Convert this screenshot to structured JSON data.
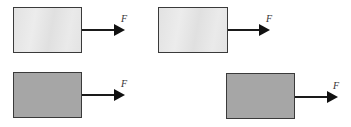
{
  "diagram": {
    "type": "force diagram",
    "panels": [
      {
        "id": "top-left",
        "block_shade": "light",
        "block_color": "#e6e6e6",
        "force_label": "F",
        "force_direction": "right"
      },
      {
        "id": "top-right",
        "block_shade": "light",
        "block_color": "#e6e6e6",
        "force_label": "F",
        "force_direction": "right"
      },
      {
        "id": "bottom-left",
        "block_shade": "dark",
        "block_color": "#a6a6a6",
        "force_label": "F",
        "force_direction": "right"
      },
      {
        "id": "bottom-right",
        "block_shade": "dark",
        "block_color": "#a6a6a6",
        "force_label": "F",
        "force_direction": "right"
      }
    ]
  }
}
